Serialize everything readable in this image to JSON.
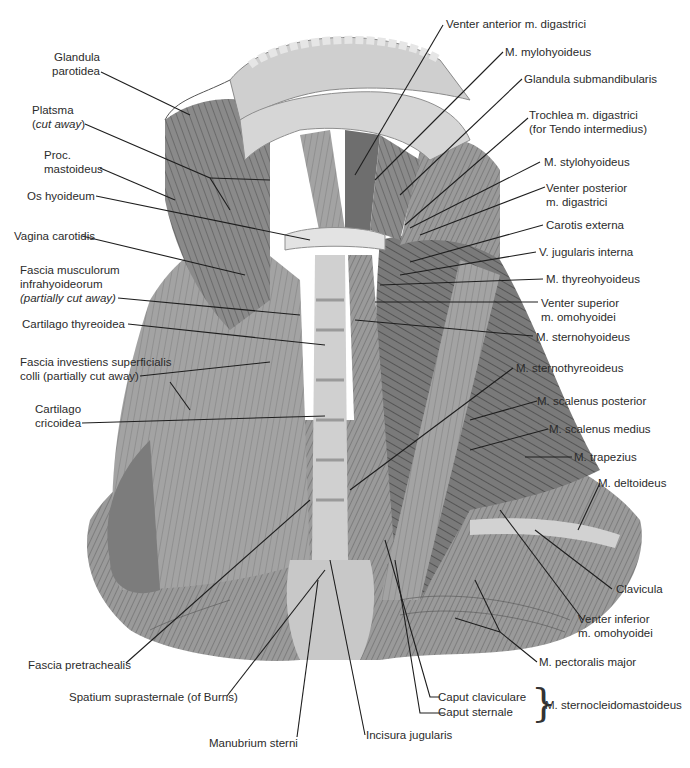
{
  "figure": {
    "colors": {
      "background": "#ffffff",
      "tissue_dark": "#5a5a5a",
      "tissue_mid": "#8c8c8c",
      "tissue_light": "#bdbdbd",
      "bone": "#d9d9d9",
      "leader": "#1e1e1e",
      "text": "#2b2b2b"
    }
  },
  "labels_left": [
    {
      "id": "glandula-parotidea",
      "line1": "Glandula",
      "line2": "parotidea"
    },
    {
      "id": "platysma",
      "line1": "Platsma",
      "line2": "(cut away)",
      "line2_italic": "cut away"
    },
    {
      "id": "proc-mastoideus",
      "line1": "Proc.",
      "line2": "mastoideus"
    },
    {
      "id": "os-hyoideum",
      "line1": "Os hyoideum"
    },
    {
      "id": "vagina-carotidis",
      "line1": "Vagina carotidis"
    },
    {
      "id": "fascia-musculorum-infrahyoideorum",
      "line1": "Fascia musculorum",
      "line2": "infrahyoideorum",
      "line3": "(partially cut away)"
    },
    {
      "id": "cartilago-thyreoidea",
      "line1": "Cartilago thyreoidea"
    },
    {
      "id": "fascia-investiens",
      "line1": "Fascia investiens superficialis",
      "line2": "colli (partially cut away)"
    },
    {
      "id": "cartilago-cricoidea",
      "line1": "Cartilago",
      "line2": "cricoidea"
    }
  ],
  "labels_right": [
    {
      "id": "venter-anterior-digastrici",
      "line1": "Venter anterior m. digastrici"
    },
    {
      "id": "m-mylohyoideus",
      "line1": "M. mylohyoideus"
    },
    {
      "id": "glandula-submandibularis",
      "line1": "Glandula submandibularis"
    },
    {
      "id": "trochlea-digastrici",
      "line1": "Trochlea m. digastrici",
      "line2": "(for Tendo intermedius)"
    },
    {
      "id": "m-stylohyoideus",
      "line1": "M. stylohyoideus"
    },
    {
      "id": "venter-posterior-digastrici",
      "line1": "Venter posterior",
      "line2": "m. digastrici"
    },
    {
      "id": "carotis-externa",
      "line1": "Carotis externa"
    },
    {
      "id": "v-jugularis-interna",
      "line1": "V. jugularis interna"
    },
    {
      "id": "m-thyreohyoideus",
      "line1": "M. thyreohyoideus"
    },
    {
      "id": "venter-superior-omohyoidei",
      "line1": "Venter superior",
      "line2": "m. omohyoidei"
    },
    {
      "id": "m-sternohyoideus",
      "line1": "M. sternohyoideus"
    },
    {
      "id": "m-sternothyreoideus",
      "line1": "M. sternothyreoideus"
    },
    {
      "id": "m-scalenus-posterior",
      "line1": "M. scalenus posterior"
    },
    {
      "id": "m-scalenus-medius",
      "line1": "M. scalenus medius"
    },
    {
      "id": "m-trapezius",
      "line1": "M. trapezius"
    },
    {
      "id": "m-deltoideus",
      "line1": "M. deltoideus"
    },
    {
      "id": "clavicula",
      "line1": "Clavicula"
    },
    {
      "id": "venter-inferior-omohyoidei",
      "line1": "Venter inferior",
      "line2": "m. omohyoidei"
    },
    {
      "id": "m-pectoralis-major",
      "line1": "M. pectoralis major"
    }
  ],
  "labels_bottom": [
    {
      "id": "fascia-pretrachealis",
      "line1": "Fascia pretrachealis"
    },
    {
      "id": "spatium-suprasternale",
      "line1": "Spatium suprasternale (of Burns)"
    },
    {
      "id": "manubrium-sterni",
      "line1": "Manubrium sterni"
    },
    {
      "id": "incisura-jugularis",
      "line1": "Incisura jugularis"
    }
  ],
  "scm_group": {
    "caput_claviculare": "Caput claviculare",
    "caput_sternale": "Caput sternale",
    "muscle": "M. sternocleidomastoideus"
  }
}
